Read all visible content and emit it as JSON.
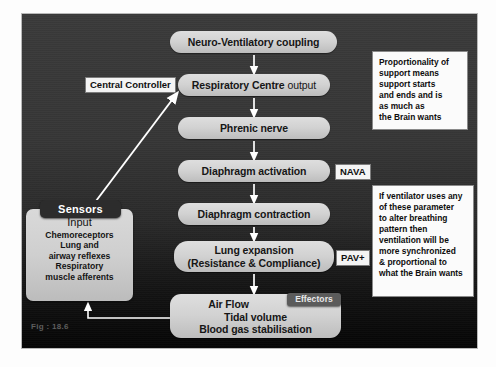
{
  "figure": {
    "caption": "Fig : 18.6",
    "background_color": "#333333",
    "pill_color": "#d2d2d2",
    "note_color": "#fbfbfb",
    "dark_tag_color": "#2c2c2c",
    "connector_color": "#ffffff"
  },
  "flow": {
    "steps": [
      {
        "id": "neuro",
        "label": "Neuro-Ventilatory coupling"
      },
      {
        "id": "resp",
        "label_bold": "Respiratory Centre",
        "label_thin": "output"
      },
      {
        "id": "phrenic",
        "label": "Phrenic nerve"
      },
      {
        "id": "diaact",
        "label": "Diaphragm activation"
      },
      {
        "id": "diacon",
        "label": "Diaphragm contraction"
      },
      {
        "id": "lung",
        "line1": "Lung expansion",
        "line2": "(Resistance & Compliance)"
      },
      {
        "id": "airflow",
        "line1": "Air Flow",
        "line2": "Tidal volume",
        "line3": "Blood gas stabilisation"
      }
    ]
  },
  "tags": {
    "central_controller": "Central Controller",
    "nava": "NAVA",
    "pav": "PAV+",
    "sensors": "Sensors",
    "effectors": "Effectors"
  },
  "sensors_box": {
    "title": "Input",
    "items": [
      "Chemoreceptors",
      "Lung and",
      "airway reflexes",
      "Respiratory",
      "muscle afferents"
    ]
  },
  "notes": {
    "top": [
      "Proportionality of",
      "support means",
      "support starts",
      "and ends and is",
      "as much as",
      "the Brain wants"
    ],
    "bottom": [
      "If ventilator uses any",
      "of these parameter",
      "to alter breathing",
      "pattern then",
      "ventilation will be",
      "more synchronized",
      "& proportional to",
      "what the Brain wants"
    ]
  }
}
